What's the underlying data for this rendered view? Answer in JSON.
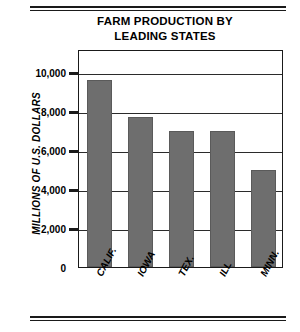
{
  "chart_data": {
    "type": "bar",
    "title": "FARM PRODUCTION BY LEADING STATES",
    "title_lines": [
      "FARM PRODUCTION BY",
      "LEADING STATES"
    ],
    "categories": [
      "CALIF.",
      "IOWA",
      "TEX.",
      "ILL",
      "MINN."
    ],
    "values": [
      9600,
      7700,
      7000,
      7000,
      5000
    ],
    "xlabel": "",
    "ylabel": "MILLIONS OF U.S. DOLLARS",
    "ylim": [
      0,
      11200
    ],
    "yticks": [
      0,
      2000,
      4000,
      6000,
      8000,
      10000
    ],
    "ytick_labels": [
      "0",
      "2,000",
      "4,000",
      "6,000",
      "8,000",
      "10,000"
    ],
    "grid": true,
    "grid_axis": "y",
    "legend": false,
    "bar_color": "#6e6e6e",
    "axis_color": "#1a1a1a"
  },
  "figure": {
    "top_rule": "double-rule",
    "bottom_rule": "double-rule"
  }
}
